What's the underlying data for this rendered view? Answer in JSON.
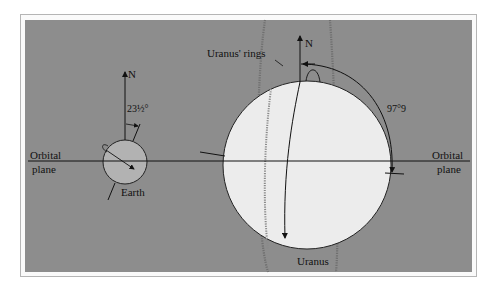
{
  "diagram": {
    "labels": {
      "earth_north": "N",
      "earth_tilt": "23½°",
      "earth_name": "Earth",
      "uranus_north": "N",
      "uranus_tilt": "97°9",
      "uranus_rings": "Uranus' rings",
      "uranus_name": "Uranus",
      "orbital_plane_left_line1": "Orbital",
      "orbital_plane_left_line2": "plane",
      "orbital_plane_right_line1": "Orbital",
      "orbital_plane_right_line2": "plane"
    },
    "colors": {
      "background": "#8d8d8d",
      "earth_fill": "#b2b2b2",
      "uranus_fill": "#ececec",
      "line": "#111111",
      "rings": "#777777"
    }
  }
}
